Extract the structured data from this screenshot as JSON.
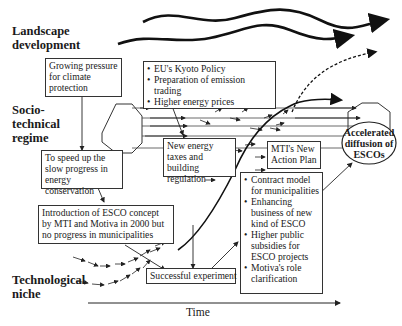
{
  "levels": {
    "landscape": [
      "Landscape",
      "development"
    ],
    "regime": [
      "Socio-",
      "technical",
      "regime"
    ],
    "niche": [
      "Technological",
      "niche"
    ]
  },
  "boxes": {
    "growing_pressure": "Growing pressure for climate protection",
    "speed_up": "To speed up the slow progress in energy conservation",
    "introduction": "Introduction of ESCO concept by MTI and Motiva in 2000 but no progress in municipalities",
    "new_taxes": "New energy taxes and building regulation",
    "mti_plan": "MTI's New Action Plan",
    "successful": "Successful experiment"
  },
  "kyoto_list": [
    "EU's Kyoto Policy",
    "Preparation of emission trading",
    "Higher energy prices"
  ],
  "contract_list": [
    "Contract model for municipalities",
    "Enhancing business of new kind of ESCO",
    "Higher public subsidies for ESCO projects",
    "Motiva's role clarification"
  ],
  "outcome": "Accelerated diffusion of ESCOs",
  "axis_label": "Time"
}
